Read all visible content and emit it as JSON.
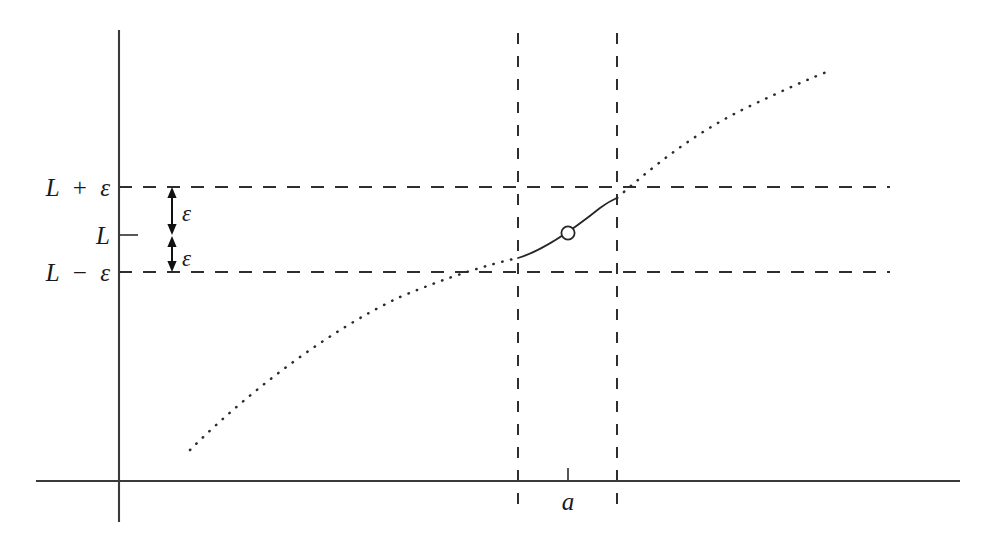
{
  "figure": {
    "background_color": "#ffffff",
    "ink_color": "#2b2b2b",
    "width": 998,
    "height": 550
  },
  "axes": {
    "x_axis": {
      "name": "horizontal-axis",
      "y": 481,
      "x_start": 36,
      "x_end": 960
    },
    "y_axis": {
      "name": "vertical-axis",
      "x": 119,
      "y_start": 30,
      "y_end": 522
    },
    "origin": {
      "x": 119,
      "y": 481
    }
  },
  "labels": {
    "upper_bound": {
      "base": "L",
      "operator": "+",
      "offset": "ε",
      "full": "L + ε",
      "value_y": 187
    },
    "limit": {
      "text": "L",
      "value_y": 235
    },
    "lower_bound": {
      "base": "L",
      "operator": "−",
      "offset": "ε",
      "full": "L − ε",
      "value_y": 272
    },
    "epsilon_upper": {
      "text": "ε"
    },
    "epsilon_lower": {
      "text": "ε"
    },
    "x_point": {
      "text": "a",
      "x": 568
    }
  },
  "guides": {
    "horizontal": [
      {
        "name": "guide-L-plus-epsilon",
        "y": 187,
        "x_start": 119,
        "x_end": 890
      },
      {
        "name": "guide-L-minus-epsilon",
        "y": 272,
        "x_start": 119,
        "x_end": 890
      }
    ],
    "vertical": [
      {
        "name": "guide-left-delta",
        "x": 518,
        "y_start": 33,
        "y_end": 512
      },
      {
        "name": "guide-right-delta",
        "x": 617,
        "y_start": 33,
        "y_end": 512
      }
    ]
  },
  "curve": {
    "description": "increasing concave-down function with a removable discontinuity at x = a",
    "dotted_left_path": "M 190 450 C 250 390 330 330 400 297 C 450 276 490 264 518 258",
    "solid_path": "M 518 258 C 545 250 575 228 600 208 C 607 203 612 200 617 198",
    "dotted_right_path": "M 617 198 C 660 160 700 130 750 106 C 780 92 810 78 832 70",
    "hole": {
      "name": "removable-discontinuity",
      "cx": 568,
      "cy": 233,
      "r": 6.6
    }
  },
  "annotations": {
    "epsilon_arrows": [
      {
        "name": "epsilon-arrow-upper",
        "x": 172,
        "y_top": 189,
        "y_bottom": 233,
        "label_x": 182,
        "label_y": 221
      },
      {
        "name": "epsilon-arrow-lower",
        "x": 172,
        "y_top": 238,
        "y_bottom": 270,
        "label_x": 182,
        "label_y": 265
      }
    ],
    "ticks": [
      {
        "name": "tick-limit-L",
        "x1": 119,
        "x2": 138,
        "y": 235
      },
      {
        "name": "tick-x-point-a",
        "x": 568,
        "y1": 481,
        "y2": 468
      }
    ]
  }
}
